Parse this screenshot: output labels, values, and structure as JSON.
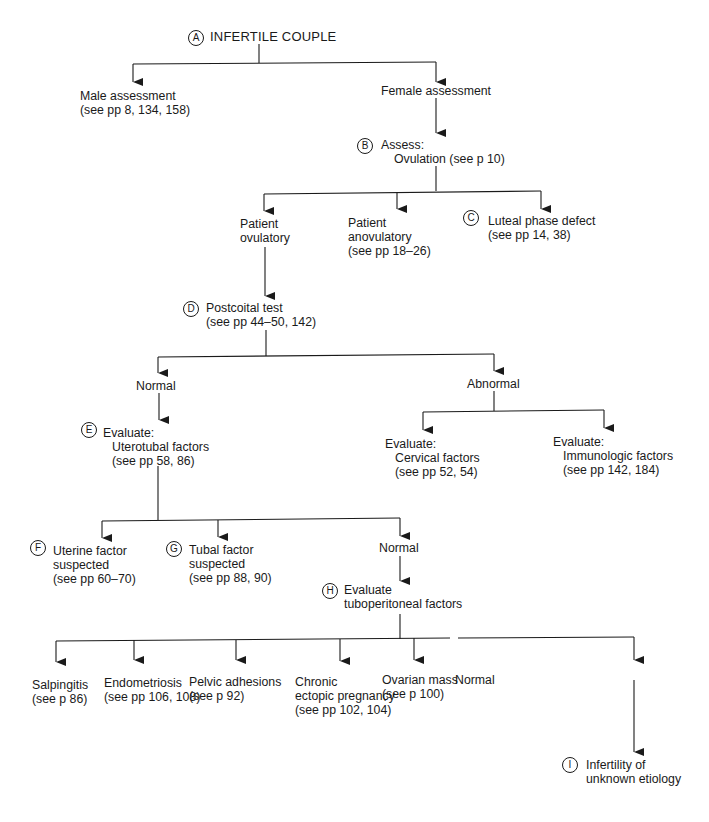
{
  "header": {
    "running_head": "ENDOCRINE"
  },
  "nodes": {
    "A": {
      "badge": "A",
      "lines": [
        "INFERTILE COUPLE"
      ]
    },
    "male": {
      "lines": [
        "Male assessment",
        "(see pp 8, 134, 158)"
      ]
    },
    "female": {
      "lines": [
        "Female assessment"
      ]
    },
    "B": {
      "badge": "B",
      "lines": [
        "Assess:",
        "Ovulation (see p 10)"
      ]
    },
    "ovulatory": {
      "lines": [
        "Patient",
        "ovulatory"
      ]
    },
    "anovulatory": {
      "lines": [
        "Patient",
        "anovulatory",
        "(see pp 18–26)"
      ]
    },
    "C": {
      "badge": "C",
      "lines": [
        "Luteal phase defect",
        "(see pp 14, 38)"
      ]
    },
    "D": {
      "badge": "D",
      "lines": [
        "Postcoital test",
        "(see pp 44–50, 142)"
      ]
    },
    "normal1": {
      "lines": [
        "Normal"
      ]
    },
    "abnormal": {
      "lines": [
        "Abnormal"
      ]
    },
    "E": {
      "badge": "E",
      "lines": [
        "Evaluate:",
        "Uterotubal factors",
        "(see pp 58, 86)"
      ]
    },
    "cervical": {
      "lines": [
        "Evaluate:",
        "Cervical factors",
        "(see pp 52, 54)"
      ]
    },
    "immuno": {
      "lines": [
        "Evaluate:",
        "Immunologic factors",
        "(see pp 142, 184)"
      ]
    },
    "F": {
      "badge": "F",
      "lines": [
        "Uterine factor",
        "suspected",
        "(see pp 60–70)"
      ]
    },
    "G": {
      "badge": "G",
      "lines": [
        "Tubal factor",
        "suspected",
        "(see pp 88, 90)"
      ]
    },
    "normal2": {
      "lines": [
        "Normal"
      ]
    },
    "H": {
      "badge": "H",
      "lines": [
        "Evaluate",
        "tuboperitoneal factors"
      ]
    },
    "salpingitis": {
      "lines": [
        "Salpingitis",
        "(see p 86)"
      ]
    },
    "endometriosis": {
      "lines": [
        "Endometriosis",
        "(see pp 106, 108)"
      ]
    },
    "adhesions": {
      "lines": [
        "Pelvic adhesions",
        "(see p 92)"
      ]
    },
    "ectopic": {
      "lines": [
        "Chronic",
        "ectopic pregnancy",
        "(see pp 102, 104)"
      ]
    },
    "ovarian": {
      "lines": [
        "Ovarian mass",
        "(see p 100)"
      ]
    },
    "normal3": {
      "lines": [
        "Normal"
      ]
    },
    "I": {
      "badge": "I",
      "lines": [
        "Infertility of",
        "unknown etiology"
      ]
    }
  },
  "colors": {
    "ink": "#1a1a1a",
    "background": "#ffffff"
  }
}
